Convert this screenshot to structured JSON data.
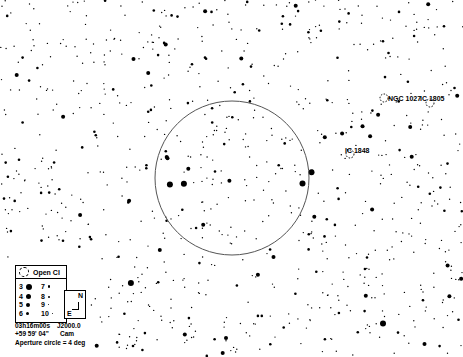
{
  "chart": {
    "type": "star-chart",
    "center_ra": "03h16m00s",
    "center_dec": "+59 59' 04\"",
    "epoch": "J2000.0",
    "constellation": "Cam",
    "aperture_text": "Aperture circle = 4 deg",
    "aperture_circle": {
      "cx": 232,
      "cy": 178,
      "r": 77,
      "color": "#555555"
    }
  },
  "objects": [
    {
      "label": "NGC 1027",
      "x": 384,
      "y": 98,
      "lx": 388,
      "ly": 95
    },
    {
      "label": "IC 1805",
      "x": 430,
      "y": 103,
      "lx": 420,
      "ly": 95
    },
    {
      "label": "IC 1848",
      "x": 350,
      "y": 154,
      "lx": 345,
      "ly": 147
    }
  ],
  "legend": {
    "title": "Open Cl",
    "magnitudes": [
      {
        "mag": "3",
        "size": 6
      },
      {
        "mag": "7",
        "size": 2.5
      },
      {
        "mag": "4",
        "size": 5
      },
      {
        "mag": "8",
        "size": 2
      },
      {
        "mag": "5",
        "size": 4
      },
      {
        "mag": "9",
        "size": 1.5
      },
      {
        "mag": "6",
        "size": 3
      },
      {
        "mag": "10",
        "size": 1.2
      }
    ],
    "compass": {
      "north": "N",
      "east": "E"
    }
  }
}
